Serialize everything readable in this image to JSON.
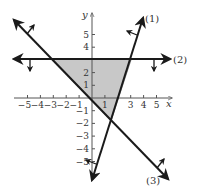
{
  "chart_data": {
    "type": "line",
    "title": "",
    "xlabel": "x",
    "ylabel": "y",
    "xlim": [
      -5.5,
      6
    ],
    "ylim": [
      -6.5,
      6.5
    ],
    "grid": false,
    "x_ticks": [
      -5,
      -4,
      -3,
      -2,
      -1,
      1,
      3,
      4,
      5
    ],
    "x_tick_labels": [
      "−5",
      "−4",
      "−3",
      "−2",
      "−1",
      "1",
      "3",
      "4",
      "5"
    ],
    "y_ticks": [
      5,
      4,
      2,
      1,
      -1,
      -2,
      -3,
      -4,
      -5
    ],
    "y_tick_labels": [
      "5",
      "4",
      "2",
      "1",
      "−1",
      "−2",
      "−3",
      "−4",
      "−5"
    ],
    "series": [
      {
        "name": "(1)",
        "equation": "y = 3x − 6",
        "shade_direction": "left",
        "x": [
          0,
          4.0
        ],
        "y": [
          -6.4,
          6.1
        ]
      },
      {
        "name": "(2)",
        "equation": "y = 3",
        "shade_direction": "down",
        "x": [
          -6.1,
          6.1
        ],
        "y": [
          3,
          3
        ]
      },
      {
        "name": "(3)",
        "equation": "y = −x",
        "shade_direction": "up-right",
        "x": [
          -6.1,
          6.0
        ],
        "y": [
          6.1,
          -6.3
        ]
      }
    ],
    "shaded_region": {
      "vertices": [
        [
          -3,
          3
        ],
        [
          3,
          3
        ],
        [
          1.5,
          -1.5
        ]
      ],
      "color": "#c8c8c8"
    }
  },
  "labels": {
    "x_axis": "x",
    "y_axis": "y",
    "line1": "(1)",
    "line2": "(2)",
    "line3": "(3)"
  },
  "colors": {
    "line": "#1a1a1a",
    "axis": "#555555",
    "shade": "#c8c8c8",
    "shade_edge": "#8a8a8a"
  }
}
